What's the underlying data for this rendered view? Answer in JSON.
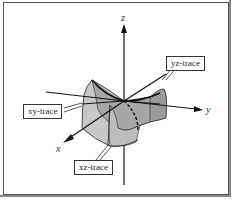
{
  "diagram": {
    "axes": {
      "x": "x",
      "y": "y",
      "z": "z"
    },
    "labels": {
      "yz_trace": "yz-trace",
      "xy_trace": "xy-trace",
      "xz_trace": "xz-trace"
    },
    "colors": {
      "surface_light": "#c8c8c8",
      "surface_mid": "#a8a8a8",
      "surface_dark": "#8c8c8c",
      "line": "#111111",
      "label_border": "#333333"
    }
  }
}
